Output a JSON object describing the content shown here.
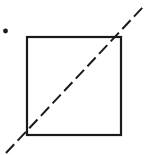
{
  "figure": {
    "title": "Square with dashed diagonal and a point",
    "canvas": {
      "width": 148,
      "height": 155,
      "background": "#ffffff"
    },
    "ink_color": "#1a1a1a",
    "shapes": {
      "square": {
        "label": "square-outline",
        "x": 27,
        "y": 37,
        "width": 94,
        "height": 98,
        "stroke_width": 2.2,
        "corners": {
          "top_left": [
            27,
            37
          ],
          "top_right": [
            121,
            37
          ],
          "bottom_right": [
            121,
            135
          ],
          "bottom_left": [
            27,
            135
          ]
        }
      },
      "diagonal": {
        "label": "dashed-diagonal-line",
        "from": [
          6,
          153
        ],
        "to": [
          143,
          7
        ],
        "stroke_width": 2.0,
        "dash_pattern": "12 5",
        "style": "dashed",
        "note": "runs through square from bottom-left corner to top-right corner, extended past both"
      },
      "point": {
        "label": "point-marker",
        "cx": 5.5,
        "cy": 31,
        "r": 2.4
      }
    }
  }
}
